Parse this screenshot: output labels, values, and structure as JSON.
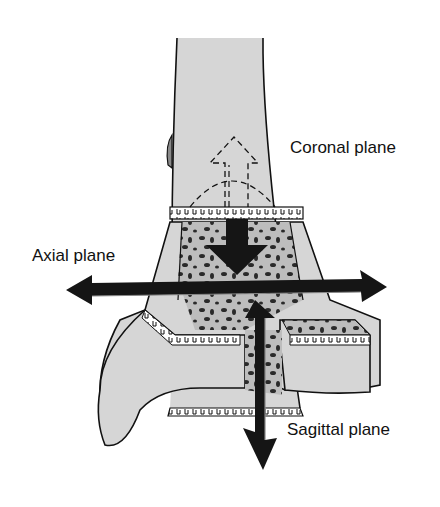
{
  "figure": {
    "labels": {
      "coronal": "Coronal plane",
      "axial": "Axial plane",
      "sagittal": "Sagittal plane"
    },
    "colors": {
      "bone_fill": "#d6d6d6",
      "outline": "#111111",
      "arrow": "#151515",
      "cancellous_spots": "#2a2a2a",
      "background": "#ffffff"
    },
    "arrows": [
      {
        "name": "coronal-arrow",
        "direction": "down",
        "style": "solid"
      },
      {
        "name": "coronal-ghost-arrow",
        "direction": "up",
        "style": "dashed"
      },
      {
        "name": "axial-arrow",
        "direction": "left-right",
        "style": "solid"
      },
      {
        "name": "sagittal-arrow",
        "direction": "up-down",
        "style": "solid"
      }
    ]
  }
}
